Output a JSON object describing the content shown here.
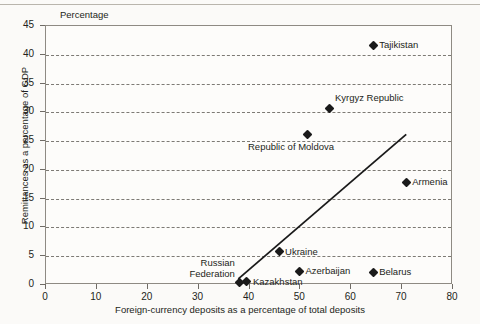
{
  "figure": {
    "unit_label": "Percentage",
    "y_axis_title": "Remittances as a percentage of GDP",
    "x_axis_title": "Foreign-currency deposits as a percentage of total deposits"
  },
  "chart_data": {
    "type": "scatter",
    "title": "",
    "xlabel": "Foreign-currency deposits as a percentage of total deposits",
    "ylabel": "Remittances as a percentage of GDP",
    "unit_label": "Percentage",
    "xlim": [
      0,
      80
    ],
    "ylim": [
      0,
      45
    ],
    "xticks": [
      0,
      10,
      20,
      30,
      40,
      50,
      60,
      70,
      80
    ],
    "yticks": [
      0,
      5,
      10,
      15,
      20,
      25,
      30,
      35,
      40,
      45
    ],
    "grid": "horizontal-dashed",
    "legend": "none",
    "marker": "diamond",
    "marker_color": "#1a1a1a",
    "points": [
      {
        "name": "Tajikistan",
        "x": 64.5,
        "y": 41.5,
        "label_side": "right"
      },
      {
        "name": "Kyrgyz Republic",
        "x": 56.0,
        "y": 30.5,
        "label_side": "above-right"
      },
      {
        "name": "Republic of Moldova",
        "x": 51.5,
        "y": 26.0,
        "label_side": "below"
      },
      {
        "name": "Armenia",
        "x": 71.0,
        "y": 17.7,
        "label_side": "right"
      },
      {
        "name": "Ukraine",
        "x": 46.0,
        "y": 5.6,
        "label_side": "right"
      },
      {
        "name": "Azerbaijan",
        "x": 50.0,
        "y": 2.2,
        "label_side": "right"
      },
      {
        "name": "Belarus",
        "x": 64.5,
        "y": 2.0,
        "label_side": "right"
      },
      {
        "name": "Kazakhstan",
        "x": 39.7,
        "y": 0.4,
        "label_side": "right"
      },
      {
        "name": "Russian Federation",
        "x": 38.3,
        "y": 0.3,
        "label_side": "above-left"
      }
    ],
    "trendline": {
      "type": "linear-fit",
      "x_start": 38.0,
      "y_start": 0.9,
      "x_end": 71.0,
      "y_end": 26.0,
      "color": "#1a1a1a"
    }
  },
  "axis_labels": {
    "y": [
      "45",
      "40",
      "35",
      "30",
      "25",
      "20",
      "15",
      "10",
      "5",
      "0"
    ],
    "x": [
      "0",
      "10",
      "20",
      "30",
      "40",
      "50",
      "60",
      "70",
      "80"
    ]
  }
}
